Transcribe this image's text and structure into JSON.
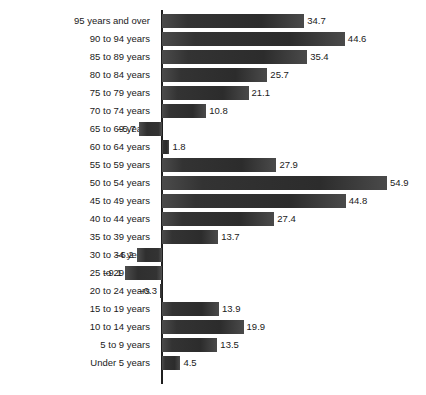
{
  "chart_data": {
    "type": "bar",
    "orientation": "horizontal",
    "title": "",
    "subtitle": "",
    "xlabel": "",
    "ylabel": "",
    "grid": false,
    "legend": null,
    "zero_line": true,
    "xlim": [
      -12,
      60
    ],
    "categories": [
      "95 years and over",
      "90 to 94 years",
      "85 to 89 years",
      "80 to 84 years",
      "75 to 79 years",
      "70 to 74 years",
      "65 to 69 years",
      "60 to 64 years",
      "55 to 59 years",
      "50 to 54 years",
      "45 to 49 years",
      "40 to 44 years",
      "35 to 39 years",
      "30 to 34 years",
      "25 to 29 years",
      "20 to 24 years",
      "15 to 19 years",
      "10 to 14 years",
      "5 to 9 years",
      "Under 5 years"
    ],
    "values": [
      34.7,
      44.6,
      35.4,
      25.7,
      21.1,
      10.8,
      -5.7,
      1.8,
      27.9,
      54.9,
      44.8,
      27.4,
      13.7,
      -6.2,
      -9.1,
      -0.3,
      13.9,
      19.9,
      13.5,
      4.5
    ],
    "value_labels": [
      "34.7",
      "44.6",
      "35.4",
      "25.7",
      "21.1",
      "10.8",
      "–5.7",
      "1.8",
      "27.9",
      "54.9",
      "44.8",
      "27.4",
      "13.7",
      "–6.2",
      "–9.1",
      "–0.3",
      "13.9",
      "19.9",
      "13.5",
      "4.5"
    ],
    "bar_color": "#333333",
    "axis_color": "#1f1f1f",
    "background": "#ffffff"
  },
  "caption": {
    "text": ""
  }
}
